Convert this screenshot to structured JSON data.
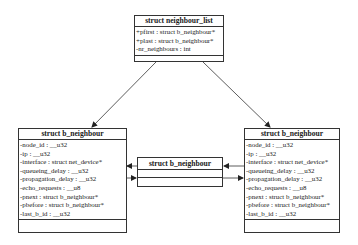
{
  "diagram": {
    "neighbour_list": {
      "title": "struct neighbour_list",
      "attributes": [
        "+pfirst : struct b_neighbour*",
        "+plast : struct b_neighbour*",
        "-nr_neighbours : int"
      ]
    },
    "b_neighbour_left": {
      "title": "struct b_neighbour",
      "attributes": [
        "-node_id : __u32",
        "-ip : __u32",
        "-interface : struct net_device*",
        "-queueing_delay : __u32",
        "-propagation_delay : __u32",
        "-echo_requests : __u8",
        "-pnext : struct b_neighbour*",
        "-pbefore : struct b_neighbour*",
        "-last_b_id : __u32"
      ]
    },
    "b_neighbour_middle": {
      "title": "struct b_neighbour"
    },
    "b_neighbour_right": {
      "title": "struct b_neighbour",
      "attributes": [
        "-node_id : __u32",
        "-ip : __u32",
        "-interface : struct net_device*",
        "-queueing_delay : __u32",
        "-propagation_delay : __u32",
        "-echo_requests : __u8",
        "-pnext : struct b_neighbour*",
        "-pbefore : struct b_neighbour*",
        "-last_b_id : __u32"
      ]
    },
    "connections": [
      {
        "from": "neighbour_list",
        "to": "b_neighbour_left",
        "label": "pfirst"
      },
      {
        "from": "neighbour_list",
        "to": "b_neighbour_right",
        "label": "plast"
      },
      {
        "from": "b_neighbour_middle",
        "to": "b_neighbour_left",
        "label": "pbefore"
      },
      {
        "from": "b_neighbour_left",
        "to": "b_neighbour_middle",
        "label": "pnext"
      },
      {
        "from": "b_neighbour_right",
        "to": "b_neighbour_middle",
        "label": "pbefore"
      },
      {
        "from": "b_neighbour_middle",
        "to": "b_neighbour_right",
        "label": "pnext"
      }
    ]
  }
}
